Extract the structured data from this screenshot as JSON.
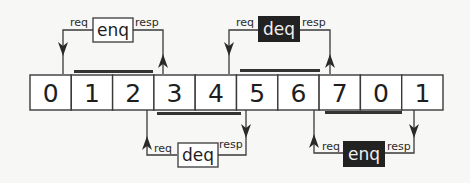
{
  "diagram": {
    "title": "",
    "colors": {
      "background": "#f7f7f5",
      "stroke": "#3a3a3a",
      "bar": "#333333",
      "dark_box": "#222222",
      "dark_text": "#f0f0f0",
      "light_box": "#ffffff",
      "light_text": "#1e1e1e"
    },
    "buffer": {
      "cells": [
        "0",
        "1",
        "2",
        "3",
        "4",
        "5",
        "6",
        "7",
        "0",
        "1"
      ]
    },
    "operations": [
      {
        "id": "enq-top",
        "label": "enq",
        "req_label": "req",
        "resp_label": "resp",
        "position": "above",
        "style": "light",
        "span_cells": [
          1,
          2
        ]
      },
      {
        "id": "deq-top",
        "label": "deq",
        "req_label": "req",
        "resp_label": "resp",
        "position": "above",
        "style": "dark",
        "span_cells": [
          5,
          6
        ]
      },
      {
        "id": "deq-bottom",
        "label": "deq",
        "req_label": "req",
        "resp_label": "resp",
        "position": "below",
        "style": "light",
        "span_cells": [
          3,
          4
        ]
      },
      {
        "id": "enq-bottom",
        "label": "enq",
        "req_label": "req",
        "resp_label": "resp",
        "position": "below",
        "style": "dark",
        "span_cells": [
          7,
          8
        ]
      }
    ]
  }
}
